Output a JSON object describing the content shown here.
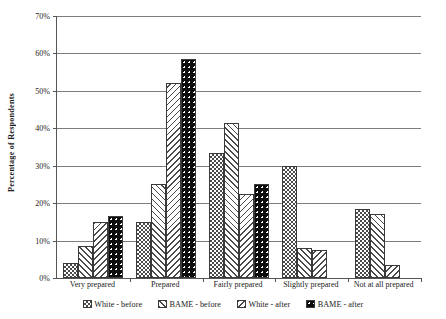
{
  "chart_data": {
    "type": "bar",
    "title": "",
    "xlabel": "",
    "ylabel": "Percentage of Respondents",
    "ylim": [
      0,
      70
    ],
    "ytick_step": 10,
    "ytick_labels": [
      "0%",
      "10%",
      "20%",
      "30%",
      "40%",
      "50%",
      "60%",
      "70%"
    ],
    "ytick_values": [
      0,
      10,
      20,
      30,
      40,
      50,
      60,
      70
    ],
    "grid": true,
    "legend_position": "bottom",
    "categories": [
      "Very prepared",
      "Prepared",
      "Fairly prepared",
      "Slightly prepared",
      "Not at all prepared"
    ],
    "series": [
      {
        "name": "White - before",
        "pattern": "checkerboard",
        "values": [
          4,
          15,
          33.5,
          30,
          18.5
        ]
      },
      {
        "name": "BAME - before",
        "pattern": "forward-diagonal-hatch",
        "values": [
          8.5,
          25,
          41.5,
          8,
          17
        ]
      },
      {
        "name": "White - after",
        "pattern": "backward-diagonal-hatch",
        "values": [
          15,
          52,
          22.5,
          7.5,
          3.5
        ]
      },
      {
        "name": "BAME - after",
        "pattern": "black-with-dots",
        "values": [
          16.5,
          58.5,
          25,
          0,
          0
        ]
      }
    ]
  },
  "legend": {
    "items": [
      {
        "label": "White - before",
        "pattern": "checkerboard"
      },
      {
        "label": "BAME - before",
        "pattern": "forward-diagonal-hatch"
      },
      {
        "label": "White - after",
        "pattern": "backward-diagonal-hatch"
      },
      {
        "label": "BAME - after",
        "pattern": "black-with-dots"
      }
    ]
  },
  "colors": {
    "background": "#ffffff",
    "gridline": "#7d7d7d",
    "axis": "#555555",
    "bar_outline": "#3a3a3a",
    "pattern_ink": "#4a4a4a",
    "bame_after_fill": "#0d0d0d",
    "text": "#1a1a1a"
  },
  "watermark": {
    "text": "¤¤"
  }
}
